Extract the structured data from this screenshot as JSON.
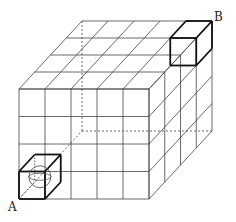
{
  "diagram": {
    "grid": {
      "cols": 5,
      "rows": 4,
      "depth": 4
    },
    "labels": {
      "a": "A",
      "b": "B"
    },
    "colors": {
      "line": "#444444",
      "bold": "#111111",
      "background": "#ffffff"
    }
  }
}
